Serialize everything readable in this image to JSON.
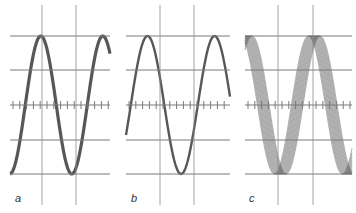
{
  "figure": {
    "panels": [
      {
        "id": "a",
        "label": "a",
        "x0": 10,
        "x1": 110,
        "verticals": [
          42,
          76
        ],
        "trace": "clean-thick",
        "phase": -1.55,
        "period": 62,
        "jitter": 0
      },
      {
        "id": "b",
        "label": "b",
        "x0": 126,
        "x1": 230,
        "verticals": [
          160,
          194
        ],
        "trace": "clean-thin",
        "phase": -0.45,
        "period": 67,
        "jitter": 0
      },
      {
        "id": "c",
        "label": "c",
        "x0": 245,
        "x1": 352,
        "verticals": [
          278,
          313
        ],
        "trace": "jittered-multi",
        "phase": 1.5,
        "period": 68,
        "jitter": 1
      }
    ],
    "grid": {
      "horizontals": [
        36,
        70,
        105,
        140,
        174
      ],
      "vertical_top": 5,
      "vertical_bottom": 205,
      "center_y": 105,
      "line_color": "#7a7a7a"
    },
    "trace_color": "#3a3a3a",
    "amplitude": 80,
    "center": 105
  }
}
